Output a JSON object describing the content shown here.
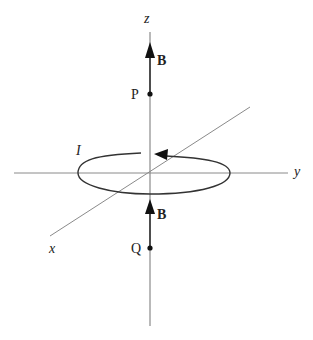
{
  "diagram": {
    "type": "physics-magnetic-field-current-loop",
    "axes": {
      "x_label": "x",
      "y_label": "y",
      "z_label": "z"
    },
    "loop": {
      "current_label": "I"
    },
    "points": [
      {
        "label": "P",
        "field_label": "B"
      },
      {
        "label": "Q",
        "field_label": "B"
      }
    ],
    "colors": {
      "axis": "#888888",
      "loop": "#333333",
      "arrow": "#111111",
      "text": "#222222"
    }
  }
}
